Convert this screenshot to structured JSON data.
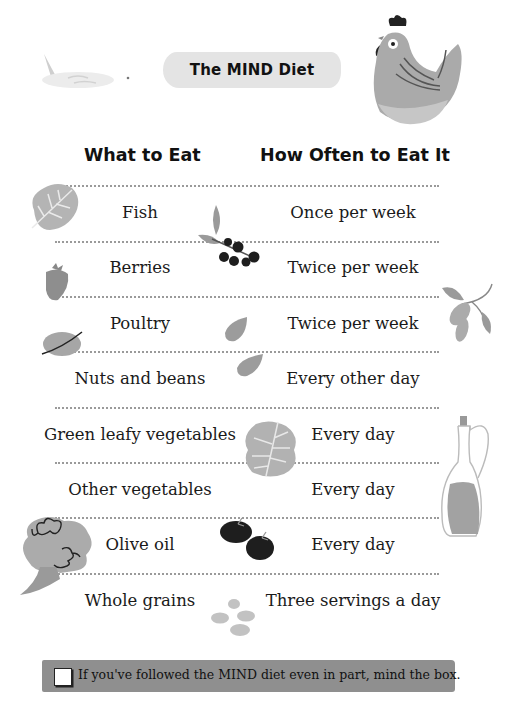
{
  "title": "The MIND Diet",
  "table": {
    "headers": [
      "What to Eat",
      "How Often to Eat It"
    ],
    "rows": [
      {
        "food": "Fish",
        "frequency": "Once per week"
      },
      {
        "food": "Berries",
        "frequency": "Twice per week"
      },
      {
        "food": "Poultry",
        "frequency": "Twice per week"
      },
      {
        "food": "Nuts and beans",
        "frequency": "Every other day"
      },
      {
        "food": "Green leafy vegetables",
        "frequency": "Every day"
      },
      {
        "food": "Other vegetables",
        "frequency": "Every day"
      },
      {
        "food": "Olive oil",
        "frequency": "Every day"
      },
      {
        "food": "Whole grains",
        "frequency": "Three servings a day"
      }
    ]
  },
  "footer": {
    "checkbox_checked": false,
    "text": "If you've followed the MIND diet even in part, mind the box."
  },
  "illustrations": [
    "fish-icon",
    "chicken-icon",
    "leaf-icon",
    "strawberry-icon",
    "nut-icon",
    "berry-branch-icon",
    "almond-icon",
    "olive-branch-icon",
    "lettuce-leaf-icon",
    "olive-oil-bottle-icon",
    "broccoli-icon",
    "tomatoes-icon",
    "grains-icon"
  ],
  "colors": {
    "text": "#1a1a1a",
    "illustration_gray": "#a8a8a8",
    "dark_berry": "#1e1e1e",
    "footer_band": "#8f8f8f",
    "title_banner": "#e4e4e4"
  }
}
